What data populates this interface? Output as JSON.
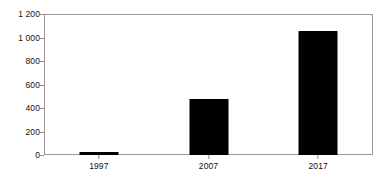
{
  "chart_data": {
    "type": "bar",
    "title": "",
    "subtitle": "",
    "xlabel": "",
    "ylabel": "",
    "categories": [
      "1997",
      "2007",
      "2017"
    ],
    "values": [
      25,
      475,
      1055
    ],
    "series": [
      {
        "name": "Series 1",
        "values": [
          25,
          475,
          1055
        ],
        "color": "#000000"
      }
    ],
    "ylim": [
      0,
      1200
    ],
    "ytick_values": [
      0,
      200,
      400,
      600,
      800,
      1000,
      1200
    ],
    "ytick_labels": [
      "0",
      "200",
      "400",
      "600",
      "800",
      "1 000",
      "1 200"
    ],
    "xtick_labels": [
      "1997",
      "2007",
      "2017"
    ],
    "grid": false,
    "legend": false,
    "legend_position": "none",
    "bar_color": "#000000",
    "axis_color": "#9a9a9a",
    "background_color": "#ffffff",
    "text_color": "#111111",
    "annotations": []
  }
}
